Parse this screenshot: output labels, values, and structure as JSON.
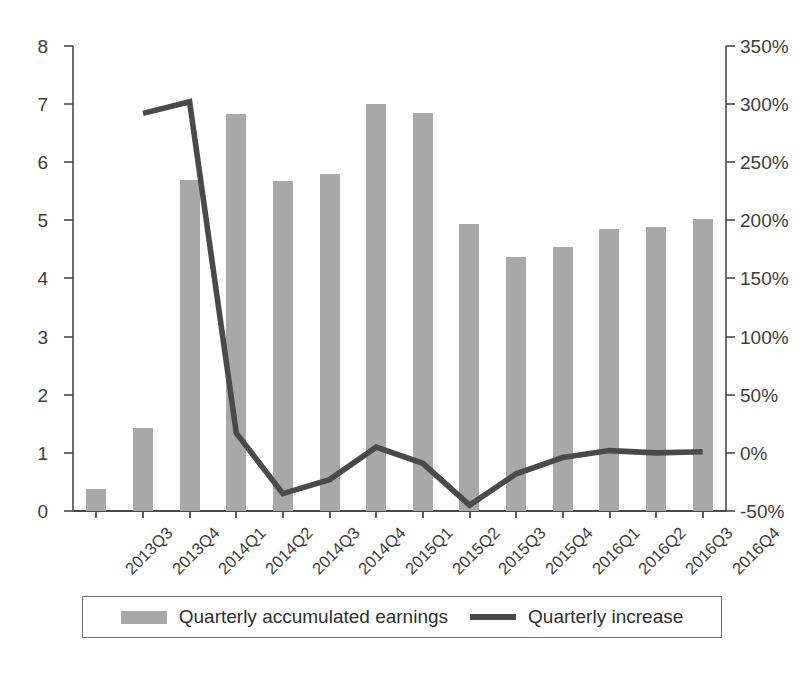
{
  "chart_data": {
    "type": "bar",
    "title": "",
    "subtitle": "",
    "xlabel": "",
    "ylabel": "",
    "y2label": "",
    "grid": false,
    "legend_position": "bottom",
    "categories": [
      "2013Q3",
      "2013Q4",
      "2014Q1",
      "2014Q2",
      "2014Q3",
      "2014Q4",
      "2015Q1",
      "2015Q2",
      "2015Q3",
      "2015Q4",
      "2016Q1",
      "2016Q2",
      "2016Q3",
      "2016Q4"
    ],
    "ylim": [
      0,
      8
    ],
    "y_ticks": [
      "0",
      "1",
      "2",
      "3",
      "4",
      "5",
      "6",
      "7",
      "8"
    ],
    "y2lim": [
      -50,
      350
    ],
    "y2_ticks": [
      "-50%",
      "0%",
      "50%",
      "100%",
      "150%",
      "200%",
      "250%",
      "300%",
      "350%"
    ],
    "series": [
      {
        "name": "Quarterly accumulated earnings",
        "type": "bar",
        "axis": "left",
        "color": "#a9a9a9",
        "values": [
          0.38,
          1.43,
          5.7,
          6.83,
          5.67,
          5.8,
          7.01,
          6.85,
          4.93,
          4.37,
          4.55,
          4.85,
          4.89,
          5.02
        ]
      },
      {
        "name": "Quarterly increase",
        "type": "line",
        "axis": "right",
        "color": "#4a4a4a",
        "values": [
          null,
          292,
          302,
          17,
          -35,
          -23,
          5,
          -9,
          -45,
          -18,
          -4,
          2,
          0,
          1
        ]
      }
    ]
  },
  "legend": {
    "items": [
      {
        "label": "Quarterly accumulated earnings",
        "marker": "bar-swatch",
        "color": "#a9a9a9"
      },
      {
        "label": "Quarterly increase",
        "marker": "line-swatch",
        "color": "#4a4a4a"
      }
    ]
  },
  "axes": {
    "left_ticks": [
      "8",
      "7",
      "6",
      "5",
      "4",
      "3",
      "2",
      "1",
      "0"
    ],
    "right_ticks": [
      "350%",
      "300%",
      "250%",
      "200%",
      "150%",
      "100%",
      "50%",
      "0%",
      "-50%"
    ]
  }
}
